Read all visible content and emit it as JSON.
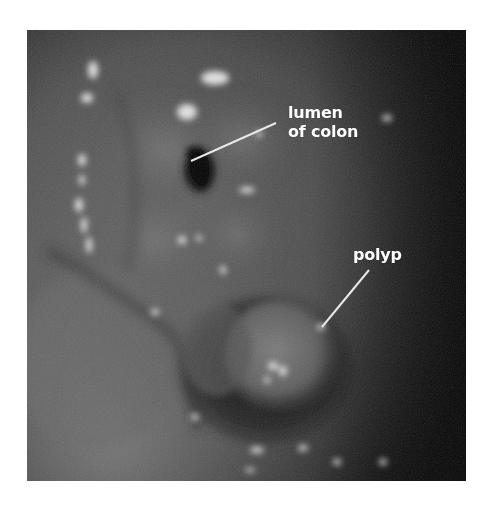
{
  "figure": {
    "labels": {
      "lumen": {
        "line1": "lumen",
        "line2": "of colon"
      },
      "polyp": {
        "text": "polyp"
      }
    },
    "colors": {
      "background": "#ffffff",
      "label_text": "#ffffff",
      "leader_line": "#e8e8e8"
    }
  }
}
